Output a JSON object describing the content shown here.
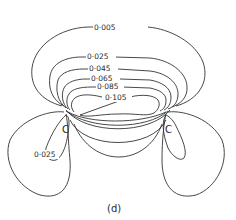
{
  "figure": {
    "panel_label": "(d)",
    "type": "contour map",
    "line_color": "#333333",
    "background": "#ffffff"
  },
  "contours": {
    "labels": [
      "0·005",
      "0·025",
      "0·045",
      "0·065",
      "0·085",
      "0·105"
    ],
    "values": [
      0.005,
      0.025,
      0.045,
      0.065,
      0.085,
      0.105
    ]
  },
  "lobes": {
    "left_label": "0·025"
  },
  "atoms": {
    "left": "C",
    "right": "C"
  }
}
